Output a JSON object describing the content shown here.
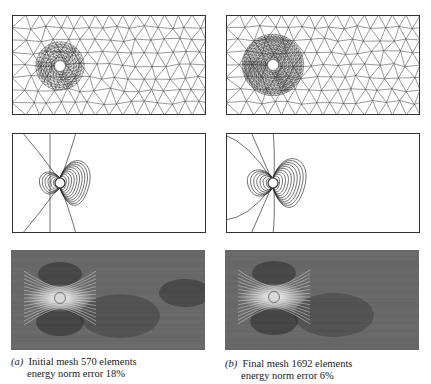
{
  "figure": {
    "columns": [
      {
        "id": "a",
        "tag": "(a)",
        "caption_line1": "Initial mesh 570 elements",
        "caption_line2": "energy norm error 18%",
        "mesh": {
          "elements": 570,
          "energy_norm_error_pct": 18
        },
        "rows": [
          "mesh",
          "contour",
          "shaded"
        ]
      },
      {
        "id": "b",
        "tag": "(b)",
        "caption_line1": "Final mesh 1692 elements",
        "caption_line2": "energy norm error 6%",
        "mesh": {
          "elements": 1692,
          "energy_norm_error_pct": 6
        },
        "rows": [
          "mesh",
          "contour",
          "shaded"
        ]
      }
    ]
  },
  "colors": {
    "line": "#333333",
    "shade_dark": "#3c3c3c",
    "shade_mid": "#6a6a6a",
    "background": "#ffffff"
  }
}
